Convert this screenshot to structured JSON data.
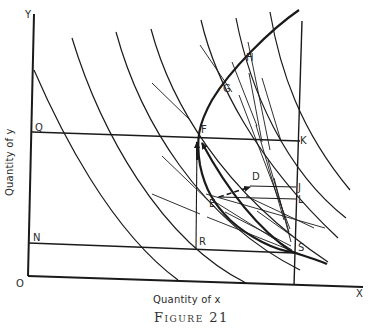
{
  "figure": {
    "caption": "Figure 21",
    "x_axis_title": "Quantity of x",
    "y_axis_title": "Quantity of y",
    "axis_labels": {
      "origin": "O",
      "x_end": "X",
      "y_end": "Y"
    },
    "points": {
      "Q": "Q",
      "N": "N",
      "F": "F",
      "G": "G",
      "H": "H",
      "K": "K",
      "D": "D",
      "J": "J",
      "L": "L",
      "E": "E",
      "R": "R",
      "S": "S"
    },
    "colors": {
      "ink": "#1a1a1a",
      "background": "#ffffff"
    }
  }
}
